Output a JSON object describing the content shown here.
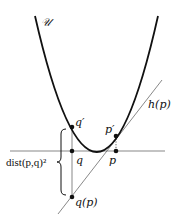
{
  "labels": {
    "curve": "𝒰",
    "q_prime": "q′",
    "p_prime": "p′",
    "q": "q",
    "p": "p",
    "h_p": "h(p)",
    "q_p": "q(p)",
    "dist": "dist(p,q)²"
  },
  "colors": {
    "curve": "#111111",
    "thin_line": "#555555",
    "point": "#111111"
  }
}
